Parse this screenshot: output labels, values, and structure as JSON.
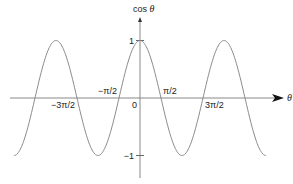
{
  "chart_data": {
    "type": "line",
    "title": "",
    "function": "cos(theta)",
    "xlabel": "θ",
    "ylabel": "cos θ",
    "ylabel_prefix": "cos ",
    "xlim_pi_units": [
      -3,
      3
    ],
    "ylim": [
      -1,
      1
    ],
    "grid": false,
    "series": [
      {
        "name": "cos θ",
        "color": "#8a8a8a",
        "x_range_pi_units": [
          -3,
          3
        ]
      }
    ],
    "x_ticks": [
      {
        "value_pi": -1.5,
        "label": "−3π/2",
        "position": "below-left"
      },
      {
        "value_pi": -0.5,
        "label": "−π/2",
        "position": "above-left"
      },
      {
        "value_pi": 0,
        "label": "0",
        "position": "below-left"
      },
      {
        "value_pi": 0.5,
        "label": "π/2",
        "position": "above-right"
      },
      {
        "value_pi": 1.5,
        "label": "3π/2",
        "position": "below-right"
      }
    ],
    "y_ticks": [
      {
        "value": 1,
        "label": "1"
      },
      {
        "value": -1,
        "label": "−1"
      }
    ]
  }
}
